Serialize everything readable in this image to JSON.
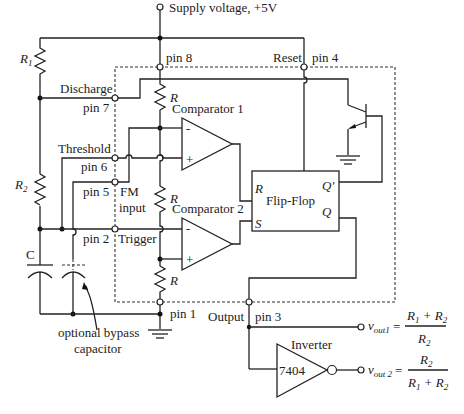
{
  "labels": {
    "supply": "Supply voltage, +5V",
    "pin8": "pin 8",
    "reset": "Reset",
    "pin4": "pin 4",
    "r1": "R",
    "r1_sub": "1",
    "r2": "R",
    "r2_sub": "2",
    "discharge": "Discharge",
    "pin7": "pin 7",
    "threshold": "Threshold",
    "pin6": "pin 6",
    "pin5": "pin 5",
    "fm": "FM",
    "fm_input": "input",
    "pin2": "pin 2",
    "trigger": "Trigger",
    "capacitor": "C",
    "bypass_line1": "optional bypass",
    "bypass_line2": "capacitor",
    "pin1": "pin 1",
    "output": "Output",
    "pin3": "pin 3",
    "resistor_r": "R",
    "comparator1": "Comparator 1",
    "comparator2": "Comparator 2",
    "minus": "-",
    "plus": "+",
    "flipflop": "Flip-Flop",
    "ff_r": "R",
    "ff_s": "S",
    "ff_qbar": "Q'",
    "ff_q": "Q",
    "inverter": "Inverter",
    "inverter_chip": "7404"
  },
  "equations": {
    "vout1": {
      "v": "v",
      "sub": "out1",
      "eq": "=",
      "num": [
        "R",
        "1",
        " + R",
        "2"
      ],
      "den": [
        "R",
        "2"
      ]
    },
    "vout2": {
      "v": "v",
      "sub": "out 2",
      "eq": "=",
      "num": [
        "R",
        "2"
      ],
      "den": [
        "R",
        "1",
        " + R",
        "2"
      ]
    }
  }
}
